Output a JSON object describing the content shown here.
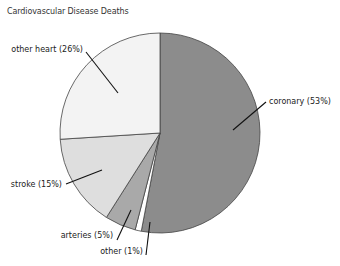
{
  "chart_data": {
    "type": "pie",
    "title": "Cardiovascular Disease Deaths",
    "start_angle_deg": 0,
    "direction": "clockwise",
    "center": [
      160,
      133
    ],
    "radius": 100,
    "slices": [
      {
        "name": "coronary",
        "label": "coronary (53%)",
        "value": 53,
        "color": "#8c8c8c",
        "leader": [
          [
            233,
            130
          ],
          [
            266,
            102
          ]
        ],
        "label_pos": [
          269,
          104
        ],
        "anchor": "start"
      },
      {
        "name": "other",
        "label": "other (1%)",
        "value": 1,
        "color": "#ffffff",
        "leader": [
          [
            150,
            222
          ],
          [
            146,
            255
          ]
        ],
        "label_pos": [
          143,
          254
        ],
        "anchor": "end"
      },
      {
        "name": "arteries",
        "label": "arteries (5%)",
        "value": 5,
        "color": "#a9a9a9",
        "leader": [
          [
            131,
            210
          ],
          [
            117,
            240
          ]
        ],
        "label_pos": [
          113,
          238
        ],
        "anchor": "end"
      },
      {
        "name": "stroke",
        "label": "stroke (15%)",
        "value": 15,
        "color": "#dedede",
        "leader": [
          [
            102,
            170
          ],
          [
            66,
            184
          ]
        ],
        "label_pos": [
          62,
          187
        ],
        "anchor": "end"
      },
      {
        "name": "other heart",
        "label": "other heart (26%)",
        "value": 26,
        "color": "#f3f3f3",
        "leader": [
          [
            118,
            93
          ],
          [
            86,
            52
          ]
        ],
        "label_pos": [
          83,
          52
        ],
        "anchor": "end"
      }
    ],
    "legend": "none (callout labels)"
  }
}
